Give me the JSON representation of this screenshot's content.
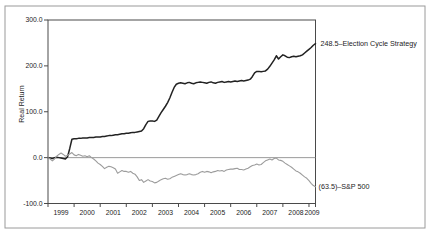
{
  "chart_data": {
    "type": "line",
    "title": "",
    "ylabel": "Real Return",
    "ylim": [
      -100,
      300
    ],
    "grid": "zero-line-only",
    "legend_position": "right-of-line-end",
    "x_interval": "monthly",
    "xlabel_ticks": [
      "1999",
      "2000",
      "2001",
      "2002",
      "2003",
      "2004",
      "2005",
      "2006",
      "2007",
      "2008",
      "2009"
    ],
    "y_ticks": [
      {
        "value": 300,
        "label": "300.0"
      },
      {
        "value": 200,
        "label": "200.0"
      },
      {
        "value": 100,
        "label": "100.0"
      },
      {
        "value": 0,
        "label": "0.0"
      },
      {
        "value": -100,
        "label": "-100.0"
      }
    ],
    "colors": {
      "axis": "#4a4a4a",
      "zero_line": "#8f8f8f",
      "border": "#9a9a9a",
      "ecs": "#222222",
      "sp500": "#9c9c9c",
      "text": "#1c1c1c"
    },
    "series": [
      {
        "name": "Election Cycle Strategy",
        "final_value": 248.5,
        "final_label": "248.5–Election Cycle Strategy",
        "color": "#222222",
        "values": [
          0,
          -1,
          -2,
          0,
          1,
          0,
          -1,
          -2,
          -3,
          2,
          20,
          40,
          41,
          41,
          42,
          42,
          43,
          43,
          43,
          44,
          44,
          44,
          45,
          45,
          45,
          46,
          46,
          47,
          48,
          48,
          49,
          50,
          50,
          51,
          52,
          52,
          53,
          53,
          54,
          55,
          55,
          56,
          57,
          58,
          63,
          72,
          79,
          80,
          80,
          79,
          82,
          90,
          98,
          105,
          112,
          120,
          130,
          142,
          153,
          160,
          162,
          163,
          162,
          161,
          163,
          164,
          162,
          161,
          163,
          164,
          165,
          164,
          163,
          162,
          164,
          165,
          163,
          162,
          164,
          165,
          166,
          164,
          165,
          166,
          165,
          166,
          167,
          166,
          167,
          168,
          167,
          168,
          169,
          171,
          177,
          185,
          188,
          188,
          187,
          188,
          189,
          193,
          199,
          206,
          213,
          222,
          215,
          220,
          224,
          222,
          219,
          218,
          220,
          221,
          220,
          221,
          222,
          224,
          228,
          232,
          236,
          240,
          245,
          248.5
        ]
      },
      {
        "name": "S&P 500",
        "final_value": -63.5,
        "final_label": "(63.5)–S&P 500",
        "color": "#9c9c9c",
        "values": [
          0,
          -3,
          -7,
          -3,
          3,
          7,
          10,
          7,
          3,
          5,
          8,
          11,
          6,
          4,
          7,
          5,
          3,
          4,
          2,
          4,
          0,
          -3,
          -7,
          -12,
          -15,
          -19,
          -24,
          -21,
          -19,
          -20,
          -22,
          -25,
          -34,
          -31,
          -28,
          -30,
          -30,
          -32,
          -30,
          -34,
          -36,
          -42,
          -50,
          -48,
          -54,
          -51,
          -48,
          -51,
          -52,
          -55,
          -54,
          -51,
          -48,
          -46,
          -45,
          -47,
          -46,
          -43,
          -41,
          -39,
          -37,
          -35,
          -37,
          -38,
          -37,
          -35,
          -37,
          -38,
          -37,
          -35,
          -32,
          -30,
          -32,
          -30,
          -31,
          -33,
          -31,
          -30,
          -28,
          -29,
          -28,
          -30,
          -27,
          -26,
          -25,
          -25,
          -24,
          -23,
          -26,
          -26,
          -27,
          -25,
          -23,
          -20,
          -17,
          -16,
          -14,
          -16,
          -15,
          -11,
          -7,
          -5,
          -3,
          -5,
          -2,
          -1,
          -5,
          -6,
          -8,
          -12,
          -15,
          -18,
          -21,
          -25,
          -29,
          -31,
          -34,
          -38,
          -42,
          -45,
          -50,
          -56,
          -61,
          -63.5
        ]
      }
    ]
  }
}
